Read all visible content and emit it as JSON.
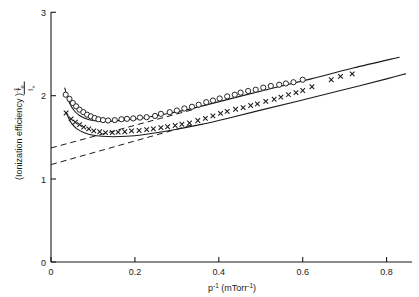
{
  "figure": {
    "background": "#ffffff",
    "ink": "#1a1a1a"
  },
  "axes": {
    "x_title_main": "p",
    "x_title_sup": "-1",
    "x_title_unit_open": " (mTorr",
    "x_title_unit_sup": "-1",
    "x_title_unit_close": ")",
    "x_title_full": "p-1 (mTorr-1)",
    "y_title_main": "(Ionization  efficiency )",
    "y_title_sup": "-1",
    "y_title_full": "(Ionization efficiency)-1",
    "y_frac_numerator": "I",
    "y_frac_numerator_sub": "e",
    "y_frac_denominator": "I",
    "y_frac_denominator_sub": "+",
    "x_ticks": [
      "0",
      "0.2",
      "0.4",
      "0.6",
      "0.8"
    ],
    "y_ticks": [
      "0",
      "1",
      "2",
      "3"
    ]
  },
  "chart_data": {
    "type": "scatter",
    "title": "",
    "xlabel": "p-1 (mTorr-1)",
    "ylabel": "(Ionization efficiency)-1",
    "xlim": [
      0,
      0.86
    ],
    "ylim": [
      0,
      3
    ],
    "xticks": [
      0,
      0.2,
      0.4,
      0.6,
      0.8
    ],
    "yticks": [
      0,
      1,
      2,
      3
    ],
    "grid": false,
    "legend": "none",
    "series": [
      {
        "name": "open-circles",
        "marker": "o",
        "x": [
          0.035,
          0.044,
          0.052,
          0.06,
          0.068,
          0.077,
          0.086,
          0.095,
          0.104,
          0.113,
          0.124,
          0.136,
          0.152,
          0.168,
          0.181,
          0.196,
          0.212,
          0.228,
          0.248,
          0.262,
          0.283,
          0.3,
          0.318,
          0.336,
          0.352,
          0.37,
          0.386,
          0.402,
          0.42,
          0.438,
          0.452,
          0.47,
          0.488,
          0.506,
          0.524,
          0.544,
          0.56,
          0.578,
          0.6
        ],
        "y": [
          2.01,
          1.96,
          1.91,
          1.87,
          1.83,
          1.8,
          1.77,
          1.75,
          1.73,
          1.715,
          1.705,
          1.7,
          1.705,
          1.715,
          1.72,
          1.725,
          1.735,
          1.74,
          1.755,
          1.78,
          1.8,
          1.82,
          1.845,
          1.865,
          1.89,
          1.92,
          1.94,
          1.965,
          1.99,
          2.01,
          2.035,
          2.055,
          2.07,
          2.095,
          2.115,
          2.13,
          2.145,
          2.16,
          2.19
        ]
      },
      {
        "name": "crosses",
        "marker": "x",
        "x": [
          0.036,
          0.048,
          0.058,
          0.068,
          0.078,
          0.09,
          0.102,
          0.116,
          0.13,
          0.146,
          0.16,
          0.176,
          0.192,
          0.21,
          0.228,
          0.244,
          0.262,
          0.278,
          0.296,
          0.312,
          0.33,
          0.35,
          0.368,
          0.386,
          0.404,
          0.42,
          0.44,
          0.458,
          0.476,
          0.492,
          0.512,
          0.532,
          0.548,
          0.566,
          0.584,
          0.6,
          0.622,
          0.668,
          0.69,
          0.718
        ],
        "y": [
          1.79,
          1.72,
          1.68,
          1.65,
          1.62,
          1.6,
          1.575,
          1.565,
          1.555,
          1.555,
          1.56,
          1.565,
          1.575,
          1.58,
          1.59,
          1.6,
          1.615,
          1.625,
          1.64,
          1.655,
          1.67,
          1.7,
          1.725,
          1.755,
          1.785,
          1.81,
          1.835,
          1.855,
          1.88,
          1.9,
          1.93,
          1.955,
          1.98,
          2.01,
          2.035,
          2.06,
          2.105,
          2.19,
          2.23,
          2.26
        ]
      }
    ],
    "fitted_curves": [
      {
        "name": "upper-solid-curve",
        "style": "solid",
        "description": "steep rise at low p-1, minimum near 0.135, linear increase thereafter",
        "x": [
          0.033,
          0.038,
          0.045,
          0.055,
          0.068,
          0.082,
          0.1,
          0.12,
          0.14,
          0.165,
          0.195,
          0.23,
          0.27,
          0.32,
          0.38,
          0.45,
          0.53,
          0.62,
          0.72,
          0.83
        ],
        "y": [
          2.09,
          1.99,
          1.9,
          1.82,
          1.76,
          1.725,
          1.7,
          1.69,
          1.69,
          1.7,
          1.715,
          1.74,
          1.775,
          1.825,
          1.9,
          1.99,
          2.09,
          2.2,
          2.33,
          2.46
        ]
      },
      {
        "name": "lower-solid-curve",
        "style": "solid",
        "description": "shallower minimum near 0.17, linear increase thereafter",
        "x": [
          0.036,
          0.042,
          0.05,
          0.062,
          0.078,
          0.098,
          0.122,
          0.15,
          0.18,
          0.215,
          0.255,
          0.3,
          0.355,
          0.42,
          0.5,
          0.59,
          0.69,
          0.8,
          0.845
        ],
        "y": [
          1.8,
          1.73,
          1.66,
          1.6,
          1.555,
          1.525,
          1.51,
          1.505,
          1.51,
          1.525,
          1.555,
          1.595,
          1.65,
          1.725,
          1.825,
          1.935,
          2.06,
          2.2,
          2.26
        ]
      }
    ],
    "dashed_lines": [
      {
        "name": "upper-dashed-extrapolation",
        "style": "dashed",
        "x": [
          0.0,
          0.345
        ],
        "y": [
          1.37,
          1.84
        ],
        "y_intercept": 1.37
      },
      {
        "name": "lower-dashed-extrapolation",
        "style": "dashed",
        "x": [
          0.0,
          0.345
        ],
        "y": [
          1.17,
          1.66
        ],
        "y_intercept": 1.17
      }
    ]
  }
}
